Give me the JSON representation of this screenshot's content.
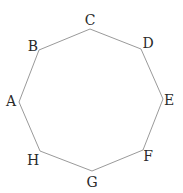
{
  "diagram": {
    "type": "regular-octagon",
    "stroke_color": "#9a9a9a",
    "label_color": "#2a2a2a",
    "vertices": [
      {
        "name": "A",
        "x": 19,
        "y": 102,
        "lx": 11,
        "ly": 106
      },
      {
        "name": "B",
        "x": 39,
        "y": 50,
        "lx": 33,
        "ly": 51
      },
      {
        "name": "C",
        "x": 90,
        "y": 29,
        "lx": 90,
        "ly": 25
      },
      {
        "name": "D",
        "x": 141,
        "y": 49,
        "lx": 148,
        "ly": 48
      },
      {
        "name": "E",
        "x": 163,
        "y": 99,
        "lx": 169,
        "ly": 105
      },
      {
        "name": "F",
        "x": 143,
        "y": 150,
        "lx": 148,
        "ly": 161
      },
      {
        "name": "G",
        "x": 92,
        "y": 171,
        "lx": 92,
        "ly": 187
      },
      {
        "name": "H",
        "x": 40,
        "y": 151,
        "lx": 33,
        "ly": 165
      }
    ]
  }
}
